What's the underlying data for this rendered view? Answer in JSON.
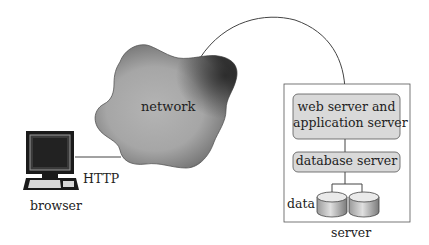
{
  "diagram": {
    "network": {
      "label": "network"
    },
    "client": {
      "label": "browser",
      "protocol_label": "HTTP"
    },
    "server": {
      "label": "server",
      "web_app_server": {
        "line1": "web server and",
        "line2": "application server"
      },
      "database_server": {
        "label": "database server"
      },
      "data": {
        "label": "data"
      }
    }
  },
  "colors": {
    "cloud_fill": "#a8a8a8",
    "cloud_dark": "#3a3a3a",
    "box_fill": "#d9d9d9",
    "stroke": "#444444",
    "screen": "#2a2a2a"
  }
}
